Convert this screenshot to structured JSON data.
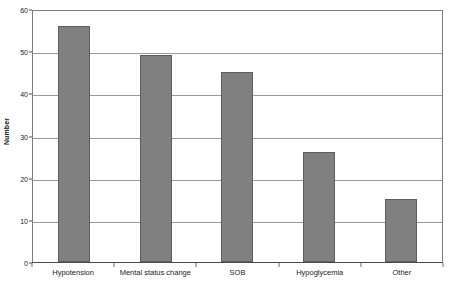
{
  "chart_data": {
    "type": "bar",
    "title": "",
    "xlabel": "",
    "ylabel": "Number",
    "categories": [
      "Hypotension",
      "Mental status change",
      "SOB",
      "Hypoglycemia",
      "Other"
    ],
    "values": [
      56,
      49,
      45,
      26,
      15
    ],
    "ylim": [
      0,
      60
    ],
    "ytick_values": [
      0,
      10,
      20,
      30,
      40,
      50,
      60
    ],
    "ytick_labels": [
      "0",
      "10",
      "20",
      "30",
      "40",
      "50",
      "60"
    ],
    "grid": "horizontal",
    "legend": "none",
    "bar_color": "#808080",
    "bar_border_color": "#5e5e5e",
    "gridline_color": "#9a9a9a",
    "frame_color": "#7d7d7d"
  }
}
